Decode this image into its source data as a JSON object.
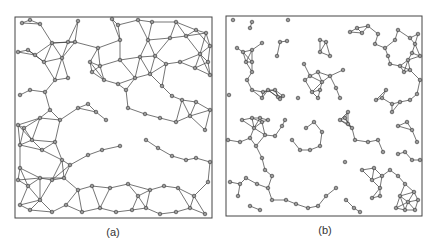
{
  "figure": {
    "background": "#ffffff",
    "edge_color": "#3a3a3a",
    "node_fill": "#9a9a9a",
    "node_stroke": "#333333",
    "frame_color": "#444444"
  },
  "panels": [
    {
      "id": "a",
      "caption": "(a)",
      "frame": {
        "x": 15,
        "y": 17,
        "w": 197,
        "h": 201
      },
      "caption_pos": {
        "x": 90,
        "y": 226
      },
      "description": "dense proximity graph",
      "nodes": [
        [
          22,
          23
        ],
        [
          30,
          20
        ],
        [
          40,
          24
        ],
        [
          78,
          21
        ],
        [
          112,
          19
        ],
        [
          118,
          25
        ],
        [
          138,
          20
        ],
        [
          152,
          22
        ],
        [
          176,
          22
        ],
        [
          196,
          30
        ],
        [
          206,
          33
        ],
        [
          210,
          46
        ],
        [
          52,
          43
        ],
        [
          68,
          42
        ],
        [
          75,
          42
        ],
        [
          98,
          48
        ],
        [
          120,
          40
        ],
        [
          148,
          40
        ],
        [
          170,
          38
        ],
        [
          186,
          36
        ],
        [
          200,
          54
        ],
        [
          208,
          62
        ],
        [
          18,
          52
        ],
        [
          28,
          50
        ],
        [
          35,
          55
        ],
        [
          44,
          62
        ],
        [
          62,
          58
        ],
        [
          90,
          62
        ],
        [
          100,
          66
        ],
        [
          120,
          60
        ],
        [
          140,
          57
        ],
        [
          155,
          56
        ],
        [
          166,
          64
        ],
        [
          180,
          62
        ],
        [
          195,
          68
        ],
        [
          210,
          75
        ],
        [
          20,
          95
        ],
        [
          30,
          90
        ],
        [
          45,
          92
        ],
        [
          55,
          80
        ],
        [
          68,
          78
        ],
        [
          92,
          72
        ],
        [
          104,
          80
        ],
        [
          118,
          84
        ],
        [
          126,
          90
        ],
        [
          135,
          78
        ],
        [
          150,
          74
        ],
        [
          162,
          86
        ],
        [
          172,
          96
        ],
        [
          182,
          100
        ],
        [
          196,
          102
        ],
        [
          210,
          110
        ],
        [
          18,
          125
        ],
        [
          24,
          128
        ],
        [
          40,
          118
        ],
        [
          50,
          110
        ],
        [
          60,
          120
        ],
        [
          78,
          108
        ],
        [
          88,
          104
        ],
        [
          96,
          112
        ],
        [
          106,
          120
        ],
        [
          128,
          108
        ],
        [
          145,
          114
        ],
        [
          160,
          118
        ],
        [
          176,
          122
        ],
        [
          190,
          116
        ],
        [
          205,
          130
        ],
        [
          20,
          145
        ],
        [
          32,
          140
        ],
        [
          42,
          150
        ],
        [
          55,
          142
        ],
        [
          62,
          160
        ],
        [
          70,
          165
        ],
        [
          88,
          155
        ],
        [
          102,
          150
        ],
        [
          120,
          146
        ],
        [
          146,
          140
        ],
        [
          158,
          148
        ],
        [
          172,
          156
        ],
        [
          186,
          160
        ],
        [
          196,
          158
        ],
        [
          210,
          162
        ],
        [
          20,
          168
        ],
        [
          18,
          180
        ],
        [
          28,
          186
        ],
        [
          40,
          178
        ],
        [
          52,
          180
        ],
        [
          64,
          178
        ],
        [
          78,
          190
        ],
        [
          92,
          186
        ],
        [
          110,
          188
        ],
        [
          128,
          184
        ],
        [
          138,
          196
        ],
        [
          150,
          190
        ],
        [
          164,
          186
        ],
        [
          178,
          188
        ],
        [
          194,
          196
        ],
        [
          208,
          182
        ],
        [
          20,
          205
        ],
        [
          30,
          210
        ],
        [
          40,
          200
        ],
        [
          52,
          212
        ],
        [
          66,
          205
        ],
        [
          82,
          212
        ],
        [
          100,
          208
        ],
        [
          116,
          212
        ],
        [
          132,
          210
        ],
        [
          146,
          208
        ],
        [
          160,
          214
        ],
        [
          176,
          212
        ],
        [
          190,
          208
        ],
        [
          205,
          214
        ]
      ],
      "edges_mode": "proximity",
      "edge_threshold": 24
    },
    {
      "id": "b",
      "caption": "(b)",
      "frame": {
        "x": 226,
        "y": 16,
        "w": 196,
        "h": 200
      },
      "caption_pos": {
        "x": 305,
        "y": 224
      },
      "description": "sparse graph",
      "nodes": [
        [
          233,
          20
        ],
        [
          252,
          22
        ],
        [
          250,
          28
        ],
        [
          288,
          20
        ],
        [
          262,
          43
        ],
        [
          280,
          42
        ],
        [
          277,
          56
        ],
        [
          287,
          41
        ],
        [
          237,
          48
        ],
        [
          243,
          52
        ],
        [
          252,
          50
        ],
        [
          246,
          62
        ],
        [
          252,
          62
        ],
        [
          252,
          72
        ],
        [
          247,
          80
        ],
        [
          229,
          95
        ],
        [
          252,
          90
        ],
        [
          263,
          92
        ],
        [
          268,
          90
        ],
        [
          275,
          90
        ],
        [
          278,
          97
        ],
        [
          262,
          98
        ],
        [
          280,
          99
        ],
        [
          283,
          96
        ],
        [
          298,
          98
        ],
        [
          340,
          98
        ],
        [
          318,
          98
        ],
        [
          320,
          40
        ],
        [
          326,
          42
        ],
        [
          320,
          52
        ],
        [
          330,
          56
        ],
        [
          304,
          64
        ],
        [
          310,
          76
        ],
        [
          318,
          72
        ],
        [
          322,
          82
        ],
        [
          330,
          76
        ],
        [
          320,
          90
        ],
        [
          312,
          92
        ],
        [
          305,
          80
        ],
        [
          336,
          88
        ],
        [
          343,
          70
        ],
        [
          357,
          28
        ],
        [
          350,
          32
        ],
        [
          362,
          33
        ],
        [
          368,
          26
        ],
        [
          378,
          34
        ],
        [
          375,
          44
        ],
        [
          385,
          48
        ],
        [
          388,
          56
        ],
        [
          390,
          64
        ],
        [
          395,
          40
        ],
        [
          398,
          30
        ],
        [
          410,
          38
        ],
        [
          418,
          34
        ],
        [
          415,
          44
        ],
        [
          420,
          56
        ],
        [
          400,
          66
        ],
        [
          404,
          72
        ],
        [
          410,
          70
        ],
        [
          408,
          60
        ],
        [
          412,
          53
        ],
        [
          382,
          98
        ],
        [
          386,
          90
        ],
        [
          376,
          100
        ],
        [
          392,
          104
        ],
        [
          400,
          102
        ],
        [
          410,
          100
        ],
        [
          417,
          94
        ],
        [
          420,
          80
        ],
        [
          260,
          118
        ],
        [
          262,
          122
        ],
        [
          268,
          120
        ],
        [
          242,
          120
        ],
        [
          252,
          118
        ],
        [
          254,
          128
        ],
        [
          265,
          135
        ],
        [
          275,
          136
        ],
        [
          282,
          126
        ],
        [
          285,
          120
        ],
        [
          292,
          140
        ],
        [
          300,
          150
        ],
        [
          310,
          150
        ],
        [
          320,
          146
        ],
        [
          322,
          132
        ],
        [
          314,
          122
        ],
        [
          306,
          128
        ],
        [
          228,
          140
        ],
        [
          240,
          142
        ],
        [
          250,
          138
        ],
        [
          230,
          182
        ],
        [
          240,
          184
        ],
        [
          246,
          178
        ],
        [
          257,
          184
        ],
        [
          268,
          188
        ],
        [
          272,
          176
        ],
        [
          265,
          170
        ],
        [
          262,
          158
        ],
        [
          256,
          146
        ],
        [
          340,
          120
        ],
        [
          348,
          124
        ],
        [
          352,
          128
        ],
        [
          348,
          112
        ],
        [
          345,
          118
        ],
        [
          355,
          140
        ],
        [
          368,
          142
        ],
        [
          378,
          140
        ],
        [
          383,
          152
        ],
        [
          398,
          154
        ],
        [
          405,
          152
        ],
        [
          412,
          160
        ],
        [
          420,
          160
        ],
        [
          392,
          112
        ],
        [
          398,
          126
        ],
        [
          407,
          122
        ],
        [
          412,
          130
        ],
        [
          417,
          142
        ],
        [
          345,
          162
        ],
        [
          362,
          170
        ],
        [
          374,
          168
        ],
        [
          382,
          176
        ],
        [
          390,
          170
        ],
        [
          398,
          176
        ],
        [
          405,
          184
        ],
        [
          414,
          192
        ],
        [
          418,
          200
        ],
        [
          372,
          180
        ],
        [
          380,
          188
        ],
        [
          238,
          196
        ],
        [
          250,
          206
        ],
        [
          260,
          210
        ],
        [
          272,
          200
        ],
        [
          286,
          200
        ],
        [
          296,
          204
        ],
        [
          308,
          208
        ],
        [
          318,
          206
        ],
        [
          326,
          196
        ],
        [
          336,
          188
        ],
        [
          346,
          200
        ],
        [
          354,
          208
        ],
        [
          360,
          212
        ],
        [
          400,
          196
        ],
        [
          408,
          202
        ],
        [
          405,
          210
        ],
        [
          396,
          208
        ],
        [
          415,
          210
        ],
        [
          372,
          198
        ],
        [
          380,
          196
        ]
      ],
      "edges_mode": "proximity",
      "edge_threshold": 15
    }
  ]
}
